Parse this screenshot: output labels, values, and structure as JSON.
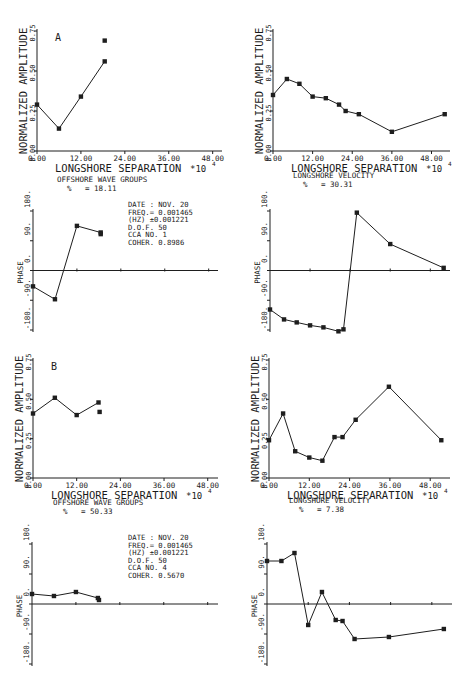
{
  "figure": {
    "caption_fragment": "Figure 10B-7 (cut off)",
    "x_multiplier_label": "*10",
    "x_multiplier_exp": "4"
  },
  "chart_data": [
    {
      "id": "A-offshore-amp",
      "panel": "A",
      "type": "line",
      "title": "OFFSHORE WAVE GROUPS",
      "percent_label": "%",
      "percent_value": "= 18.11",
      "xlabel": "LONGSHORE SEPARATION",
      "ylabel": "NORMALIZED AMPLITUDE",
      "xticks": [
        "0.00",
        "12.00",
        "24.00",
        "36.00",
        "48.00"
      ],
      "yticks": [
        "0.00",
        "0.25",
        "0.50",
        "0.75"
      ],
      "xlim": [
        0,
        50
      ],
      "ylim": [
        0,
        0.75
      ],
      "x": [
        0,
        6,
        12,
        18.5
      ],
      "y": [
        0.29,
        0.14,
        0.34,
        0.56
      ],
      "extra_points": [
        {
          "x": 18.5,
          "y": 0.69
        }
      ]
    },
    {
      "id": "A-velocity-amp",
      "panel": "A",
      "type": "line",
      "title": "LONGSHORE VELOCITY",
      "percent_label": "%",
      "percent_value": "= 30.31",
      "xlabel": "LONGSHORE SEPARATION",
      "ylabel": "NORMALIZED AMPLITUDE",
      "xticks": [
        "0.00",
        "12.00",
        "24.00",
        "36.00",
        "48.00"
      ],
      "yticks": [
        "0.00",
        "0.25",
        "0.50",
        "0.75"
      ],
      "xlim": [
        0,
        53
      ],
      "ylim": [
        0,
        0.75
      ],
      "x": [
        0,
        4.2,
        8,
        12,
        16,
        20,
        22,
        26,
        36,
        52
      ],
      "y": [
        0.35,
        0.45,
        0.42,
        0.34,
        0.33,
        0.29,
        0.25,
        0.23,
        0.12,
        0.23
      ],
      "extra_points": []
    },
    {
      "id": "A-offshore-phase",
      "panel": "A",
      "type": "line",
      "ylabel": "PHASE",
      "yticks": [
        "-180.",
        "-90.",
        "0.",
        "90.",
        "180."
      ],
      "xlim": [
        0,
        50
      ],
      "ylim": [
        -180,
        180
      ],
      "x": [
        0,
        6,
        12,
        18.5
      ],
      "y": [
        -48,
        -87,
        135,
        115
      ],
      "extra_points": [
        {
          "x": 18.5,
          "y": 110
        }
      ],
      "info": [
        "DATE : NOV. 20",
        "FREQ.= 0.001465",
        " (HZ) ±0.001221",
        "D.O.F. 50",
        "CCA NO. 1",
        "COHER. 0.8986"
      ]
    },
    {
      "id": "A-velocity-phase",
      "panel": "A",
      "type": "line",
      "ylabel": "PHASE",
      "yticks": [
        "-180.",
        "-90.",
        "0.",
        "90.",
        "180."
      ],
      "xlim": [
        0,
        53
      ],
      "ylim": [
        -180,
        180
      ],
      "x": [
        0,
        4.2,
        8,
        12,
        16,
        20.5,
        22,
        26,
        36,
        52
      ],
      "y": [
        -118,
        -148,
        -157,
        -166,
        -172,
        -184,
        -178,
        175,
        80,
        8
      ],
      "extra_points": []
    },
    {
      "id": "B-offshore-amp",
      "panel": "B",
      "type": "line",
      "title": "OFFSHORE WAVE GROUPS",
      "percent_label": "%",
      "percent_value": "= 50.33",
      "xlabel": "LONGSHORE SEPARATION",
      "ylabel": "NORMALIZED AMPLITUDE",
      "xticks": [
        "0.00",
        "12.00",
        "24.00",
        "36.00",
        "48.00"
      ],
      "yticks": [
        "0.00",
        "0.25",
        "0.50",
        "0.75"
      ],
      "xlim": [
        0,
        50
      ],
      "ylim": [
        0,
        0.75
      ],
      "x": [
        0,
        6,
        12,
        18
      ],
      "y": [
        0.41,
        0.51,
        0.4,
        0.48
      ],
      "extra_points": [
        {
          "x": 18.3,
          "y": 0.42
        }
      ]
    },
    {
      "id": "B-velocity-amp",
      "panel": "B",
      "type": "line",
      "title": "LONGSHORE VELOCITY",
      "percent_label": "%",
      "percent_value": "= 7.38",
      "xlabel": "LONGSHORE SEPARATION",
      "ylabel": "NORMALIZED AMPLITUDE",
      "xticks": [
        "0.00",
        "12.00",
        "24.00",
        "36.00",
        "48.00"
      ],
      "yticks": [
        "0.00",
        "0.25",
        "0.50",
        "0.75"
      ],
      "xlim": [
        0,
        53
      ],
      "ylim": [
        0,
        0.75
      ],
      "x": [
        0,
        4.2,
        7.8,
        12,
        15.9,
        19.5,
        21.9,
        25.8,
        35.7,
        51.3
      ],
      "y": [
        0.24,
        0.41,
        0.17,
        0.13,
        0.11,
        0.26,
        0.26,
        0.37,
        0.58,
        0.24
      ],
      "extra_points": []
    },
    {
      "id": "B-offshore-phase",
      "panel": "B",
      "type": "line",
      "ylabel": "PHASE",
      "yticks": [
        "-180.",
        "-90.",
        "0.",
        "90.",
        "180."
      ],
      "xlim": [
        0,
        50
      ],
      "ylim": [
        -180,
        180
      ],
      "x": [
        0,
        6,
        12,
        18
      ],
      "y": [
        30,
        24,
        36,
        18
      ],
      "extra_points": [
        {
          "x": 18.3,
          "y": 12
        }
      ],
      "info": [
        "DATE : NOV. 20",
        "FREQ.= 0.001465",
        " (HZ) ±0.001221",
        "D.O.F. 50",
        "CCA NO. 4",
        "COHER. 0.5670"
      ]
    },
    {
      "id": "B-velocity-phase",
      "panel": "B",
      "type": "line",
      "ylabel": "PHASE",
      "yticks": [
        "-180.",
        "-90.",
        "0.",
        "90.",
        "180."
      ],
      "xlim": [
        0,
        53
      ],
      "ylim": [
        -180,
        180
      ],
      "x": [
        0,
        4.2,
        8,
        12,
        16,
        20,
        22,
        25.5,
        35.5,
        51.5
      ],
      "y": [
        129,
        129,
        153,
        -63,
        36,
        -48,
        -51,
        -105,
        -99,
        -75
      ],
      "extra_points": []
    }
  ],
  "layout": {
    "plots": [
      {
        "ax": 37,
        "top": 31,
        "bottom": 151,
        "right": 222,
        "xend": 220,
        "kind": "amp",
        "panelLabel": "A",
        "titleY": 182
      },
      {
        "ax": 273,
        "top": 31,
        "bottom": 151,
        "right": 450,
        "xend": 448,
        "kind": "amp",
        "panelLabel": "",
        "titleY": 178
      },
      {
        "ax": 33,
        "top": 211,
        "bottom": 330,
        "right": 218,
        "xend": 216,
        "kind": "phase"
      },
      {
        "ax": 270,
        "top": 211,
        "bottom": 330,
        "right": 450,
        "xend": 447,
        "kind": "phase"
      },
      {
        "ax": 33,
        "top": 360,
        "bottom": 478,
        "right": 218,
        "xend": 215,
        "kind": "amp",
        "panelLabel": "B",
        "titleY": 505
      },
      {
        "ax": 269,
        "top": 360,
        "bottom": 478,
        "right": 450,
        "xend": 447,
        "kind": "amp",
        "panelLabel": "",
        "titleY": 503
      },
      {
        "ax": 32,
        "top": 544,
        "bottom": 664,
        "right": 218,
        "xend": 215,
        "kind": "phase"
      },
      {
        "ax": 267,
        "top": 544,
        "bottom": 664,
        "right": 452,
        "xend": 449,
        "kind": "phase"
      }
    ]
  }
}
